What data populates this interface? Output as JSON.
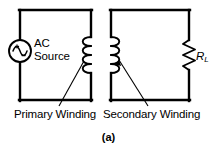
{
  "figure": {
    "caption": "(a)",
    "type": "transformer-circuit-schematic",
    "stroke_color": "#000000",
    "background_color": "#ffffff"
  },
  "primary_circuit": {
    "source": {
      "label_line1": "AC",
      "label_line2": "Source",
      "symbol": "ac-voltage-source"
    },
    "winding": {
      "label": "Primary Winding",
      "turns": 4
    }
  },
  "secondary_circuit": {
    "winding": {
      "label": "Secondary Winding",
      "turns": 4
    },
    "load": {
      "label": "R",
      "subscript": "L",
      "symbol": "resistor-zigzag"
    }
  }
}
